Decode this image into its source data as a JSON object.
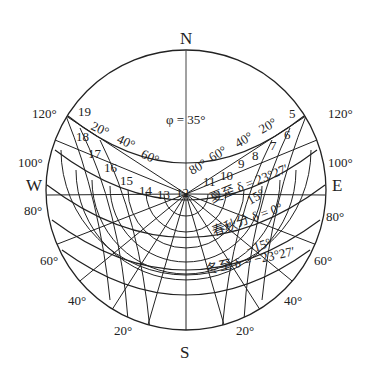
{
  "diagram": {
    "latitude_label": "φ = 35°",
    "cardinals": {
      "north": "N",
      "south": "S",
      "west": "W",
      "east": "E"
    },
    "azimuth_labels_left": [
      "120°",
      "100°",
      "80°",
      "60°",
      "40°",
      "20°"
    ],
    "azimuth_labels_right": [
      "120°",
      "100°",
      "80°",
      "60°",
      "40°",
      "20°"
    ],
    "altitude_labels_left": [
      "20°",
      "40°",
      "60°"
    ],
    "altitude_labels_right": [
      "80°",
      "60°",
      "40°",
      "20°"
    ],
    "hours_left": [
      "19",
      "18",
      "17",
      "16",
      "15",
      "14",
      "13",
      "12"
    ],
    "hours_right": [
      "11",
      "10",
      "9",
      "8",
      "7",
      "6",
      "5"
    ],
    "declination_labels": {
      "summer": "夏至 δ = 23°27′",
      "plus15": "15°",
      "equinox": "春秋分 δ = 0°",
      "minus15": "−15°",
      "winter": "冬至 δ = −23°27′"
    }
  }
}
